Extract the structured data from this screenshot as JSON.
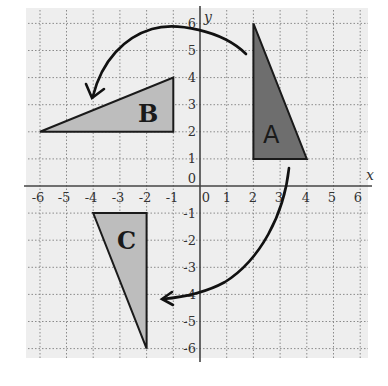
{
  "diagram": {
    "axes": {
      "x_label": "x",
      "y_label": "y",
      "x_range": [
        -6,
        6
      ],
      "y_range": [
        -6,
        6
      ],
      "x_ticks": [
        "-6",
        "-5",
        "-4",
        "-3",
        "-2",
        "-1",
        "0",
        "1",
        "2",
        "3",
        "4",
        "5",
        "6"
      ],
      "y_ticks": [
        "6",
        "5",
        "4",
        "3",
        "2",
        "1",
        "0",
        "-1",
        "-2",
        "-3",
        "-4",
        "-5",
        "-6"
      ],
      "origin_label": "0",
      "grid": "dotted"
    },
    "shapes": [
      {
        "label": "A",
        "vertices": [
          [
            2,
            6
          ],
          [
            2,
            1
          ],
          [
            4,
            1
          ]
        ],
        "fill": "#6e6e6e"
      },
      {
        "label": "B",
        "vertices": [
          [
            -6,
            2
          ],
          [
            -1,
            2
          ],
          [
            -1,
            4
          ]
        ],
        "fill": "#bdbdbd"
      },
      {
        "label": "C",
        "vertices": [
          [
            -4,
            -1
          ],
          [
            -2,
            -1
          ],
          [
            -2,
            -6
          ]
        ],
        "fill": "#bdbdbd"
      }
    ],
    "arrows": [
      {
        "from": "A",
        "to": "B",
        "direction": "counterclockwise"
      },
      {
        "from": "A",
        "to": "C",
        "direction": "clockwise"
      }
    ],
    "colors": {
      "background": "#eeeeee",
      "grid": "#888888",
      "axis": "#444444",
      "outline": "#1a1a1a"
    }
  }
}
